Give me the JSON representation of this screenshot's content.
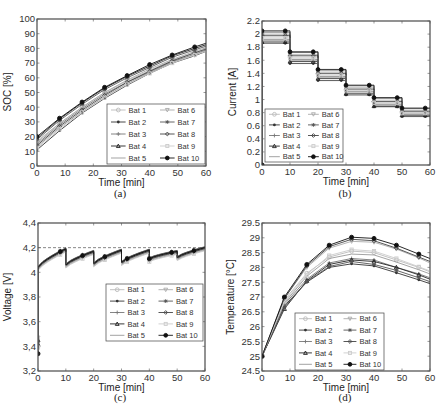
{
  "legend_labels": [
    "Bat 1",
    "Bat 2",
    "Bat 3",
    "Bat 4",
    "Bat 5",
    "Bat 6",
    "Bat 7",
    "Bat 8",
    "Bat 9",
    "Bat 10"
  ],
  "series_styles": [
    {
      "name": "Bat 1",
      "color": "#bbbbbb",
      "marker": "circle-open"
    },
    {
      "name": "Bat 2",
      "color": "#333333",
      "marker": "dot"
    },
    {
      "name": "Bat 3",
      "color": "#777777",
      "marker": "plus"
    },
    {
      "name": "Bat 4",
      "color": "#222222",
      "marker": "triangle"
    },
    {
      "name": "Bat 5",
      "color": "#999999",
      "marker": "none"
    },
    {
      "name": "Bat 6",
      "color": "#aaaaaa",
      "marker": "triangle-down"
    },
    {
      "name": "Bat 7",
      "color": "#555555",
      "marker": "star"
    },
    {
      "name": "Bat 8",
      "color": "#444444",
      "marker": "diamond-open"
    },
    {
      "name": "Bat 9",
      "color": "#cccccc",
      "marker": "square"
    },
    {
      "name": "Bat 10",
      "color": "#111111",
      "marker": "circle-filled"
    }
  ],
  "chart_data": [
    {
      "id": "a",
      "caption": "(a)",
      "type": "line",
      "title": "",
      "xlabel": "Time [min]",
      "ylabel": "SOC [%]",
      "xlim": [
        0,
        60
      ],
      "ylim": [
        0,
        100
      ],
      "xticks": [
        0,
        10,
        20,
        30,
        40,
        50,
        60
      ],
      "yticks": [
        0,
        10,
        20,
        30,
        40,
        50,
        60,
        70,
        80,
        90,
        100
      ],
      "x": [
        0,
        8,
        16,
        24,
        32,
        40,
        48,
        56,
        60
      ],
      "series": [
        {
          "name": "Bat 1",
          "values": [
            17,
            29,
            40,
            50,
            58,
            65,
            72,
            77,
            80
          ]
        },
        {
          "name": "Bat 2",
          "values": [
            11,
            24,
            36,
            46,
            55,
            63,
            70,
            75,
            78
          ]
        },
        {
          "name": "Bat 3",
          "values": [
            15,
            28,
            39,
            49,
            57,
            64,
            71,
            76,
            79
          ]
        },
        {
          "name": "Bat 4",
          "values": [
            19,
            32,
            43,
            53,
            61,
            68,
            75,
            80,
            82.5
          ]
        },
        {
          "name": "Bat 5",
          "values": [
            13,
            26,
            37,
            47,
            56,
            63.5,
            70.5,
            75.5,
            78.5
          ]
        },
        {
          "name": "Bat 6",
          "values": [
            16,
            29,
            40,
            50,
            58.5,
            66,
            72.5,
            78,
            80.5
          ]
        },
        {
          "name": "Bat 7",
          "values": [
            18,
            31,
            42,
            52,
            60,
            67,
            74,
            79,
            81.5
          ]
        },
        {
          "name": "Bat 8",
          "values": [
            14,
            27,
            38,
            48,
            57,
            64.5,
            71.5,
            77,
            79.5
          ]
        },
        {
          "name": "Bat 9",
          "values": [
            12,
            25,
            36.5,
            46.5,
            55.5,
            63,
            70,
            75.5,
            78
          ]
        },
        {
          "name": "Bat 10",
          "values": [
            20,
            32.5,
            43.5,
            53.5,
            61.5,
            69,
            75.5,
            81,
            83.5
          ]
        }
      ],
      "legend_position": "lower right",
      "grid": false
    },
    {
      "id": "b",
      "caption": "(b)",
      "type": "line",
      "title": "",
      "xlabel": "Time [min]",
      "ylabel": "Current [A]",
      "xlim": [
        0,
        60
      ],
      "ylim": [
        0,
        2.2
      ],
      "xticks": [
        0,
        10,
        20,
        30,
        40,
        50,
        60
      ],
      "yticks": [
        0,
        0.2,
        0.4,
        0.6,
        0.8,
        1,
        1.2,
        1.4,
        1.6,
        1.8,
        2,
        2.2
      ],
      "step_edges": [
        0,
        10,
        20,
        30,
        40,
        50,
        60
      ],
      "series": [
        {
          "name": "Bat 1",
          "values": [
            1.96,
            1.65,
            1.39,
            1.15,
            0.96,
            0.8
          ]
        },
        {
          "name": "Bat 2",
          "values": [
            1.86,
            1.55,
            1.29,
            1.07,
            0.89,
            0.74
          ]
        },
        {
          "name": "Bat 3",
          "values": [
            1.92,
            1.61,
            1.35,
            1.12,
            0.93,
            0.78
          ]
        },
        {
          "name": "Bat 4",
          "values": [
            1.88,
            1.58,
            1.32,
            1.09,
            0.9,
            0.76
          ]
        },
        {
          "name": "Bat 5",
          "values": [
            1.9,
            1.6,
            1.34,
            1.1,
            0.92,
            0.77
          ]
        },
        {
          "name": "Bat 6",
          "values": [
            2.0,
            1.69,
            1.42,
            1.18,
            0.99,
            0.83
          ]
        },
        {
          "name": "Bat 7",
          "values": [
            2.03,
            1.72,
            1.45,
            1.21,
            1.02,
            0.86
          ]
        },
        {
          "name": "Bat 8",
          "values": [
            1.98,
            1.67,
            1.4,
            1.16,
            0.97,
            0.82
          ]
        },
        {
          "name": "Bat 9",
          "values": [
            1.94,
            1.63,
            1.37,
            1.14,
            0.95,
            0.79
          ]
        },
        {
          "name": "Bat 10",
          "values": [
            2.05,
            1.73,
            1.46,
            1.22,
            1.03,
            0.87
          ]
        }
      ],
      "start_value": 0,
      "legend_position": "lower left",
      "grid": false
    },
    {
      "id": "c",
      "caption": "(c)",
      "type": "line",
      "title": "",
      "xlabel": "Time [min]",
      "ylabel": "Voltage [V]",
      "xlim": [
        0,
        60
      ],
      "ylim": [
        3.2,
        4.4
      ],
      "xticks": [
        0,
        10,
        20,
        30,
        40,
        50,
        60
      ],
      "yticks": [
        3.2,
        3.4,
        3.6,
        3.8,
        4,
        4.2,
        4.4
      ],
      "yticklabels": [
        "3,2",
        "3,4",
        "3,6",
        "3,8",
        "4",
        "4,2",
        "4,4"
      ],
      "reference_line": {
        "y": 4.2,
        "style": "dashed"
      },
      "initial_values": [
        3.4,
        3.46,
        3.42,
        3.45,
        3.38,
        3.47,
        3.44,
        3.41,
        3.39,
        3.34
      ],
      "segments": [
        {
          "t0": 0,
          "t1": 10,
          "v0": 4.04,
          "v1": 4.19
        },
        {
          "t0": 10,
          "t1": 20,
          "v0": 4.06,
          "v1": 4.17
        },
        {
          "t0": 20,
          "t1": 30,
          "v0": 4.07,
          "v1": 4.18
        },
        {
          "t0": 30,
          "t1": 40,
          "v0": 4.08,
          "v1": 4.18
        },
        {
          "t0": 40,
          "t1": 50,
          "v0": 4.11,
          "v1": 4.17
        },
        {
          "t0": 50,
          "t1": 60,
          "v0": 4.12,
          "v1": 4.2
        }
      ],
      "series": [
        {
          "name": "Bat 1",
          "offset": -0.01
        },
        {
          "name": "Bat 2",
          "offset": 0.0
        },
        {
          "name": "Bat 3",
          "offset": -0.005
        },
        {
          "name": "Bat 4",
          "offset": 0.005
        },
        {
          "name": "Bat 5",
          "offset": -0.02
        },
        {
          "name": "Bat 6",
          "offset": -0.015
        },
        {
          "name": "Bat 7",
          "offset": 0.008
        },
        {
          "name": "Bat 8",
          "offset": -0.008
        },
        {
          "name": "Bat 9",
          "offset": -0.025
        },
        {
          "name": "Bat 10",
          "offset": 0.0
        }
      ],
      "legend_position": "center right",
      "grid": false
    },
    {
      "id": "d",
      "caption": "(d)",
      "type": "line",
      "title": "",
      "xlabel": "Time [min]",
      "ylabel": "Temperature [°C]",
      "xlim": [
        0,
        60
      ],
      "ylim": [
        24.5,
        29.5
      ],
      "xticks": [
        0,
        10,
        20,
        30,
        40,
        50,
        60
      ],
      "yticks": [
        24.5,
        25,
        25.5,
        26,
        26.5,
        27,
        27.5,
        28,
        28.5,
        29,
        29.5
      ],
      "x": [
        0,
        8,
        16,
        24,
        32,
        40,
        48,
        56,
        60
      ],
      "series": [
        {
          "name": "Bat 1",
          "values": [
            25,
            26.9,
            27.8,
            28.35,
            28.55,
            28.5,
            28.25,
            28.0,
            27.85
          ]
        },
        {
          "name": "Bat 2",
          "values": [
            25,
            26.7,
            27.5,
            28.0,
            28.12,
            28.05,
            27.82,
            27.58,
            27.45
          ]
        },
        {
          "name": "Bat 3",
          "values": [
            25,
            26.75,
            27.6,
            28.15,
            28.3,
            28.25,
            28.0,
            27.78,
            27.65
          ]
        },
        {
          "name": "Bat 4",
          "values": [
            25,
            26.6,
            27.55,
            28.1,
            28.25,
            28.2,
            28.0,
            27.75,
            27.6
          ]
        },
        {
          "name": "Bat 5",
          "values": [
            25,
            26.8,
            27.7,
            28.3,
            28.45,
            28.42,
            28.18,
            27.92,
            27.78
          ]
        },
        {
          "name": "Bat 6",
          "values": [
            25,
            26.95,
            28.0,
            28.65,
            28.88,
            28.85,
            28.62,
            28.32,
            28.15
          ]
        },
        {
          "name": "Bat 7",
          "values": [
            25,
            26.65,
            27.52,
            28.03,
            28.2,
            28.1,
            27.9,
            27.65,
            27.52
          ]
        },
        {
          "name": "Bat 8",
          "values": [
            25,
            26.95,
            28.05,
            28.7,
            28.95,
            28.9,
            28.65,
            28.35,
            28.2
          ]
        },
        {
          "name": "Bat 9",
          "values": [
            25,
            26.85,
            27.75,
            28.4,
            28.6,
            28.55,
            28.3,
            28.02,
            27.88
          ]
        },
        {
          "name": "Bat 10",
          "values": [
            25,
            27.0,
            28.1,
            28.75,
            29.02,
            28.98,
            28.75,
            28.45,
            28.3
          ]
        }
      ],
      "legend_position": "lower center",
      "grid": false
    }
  ]
}
